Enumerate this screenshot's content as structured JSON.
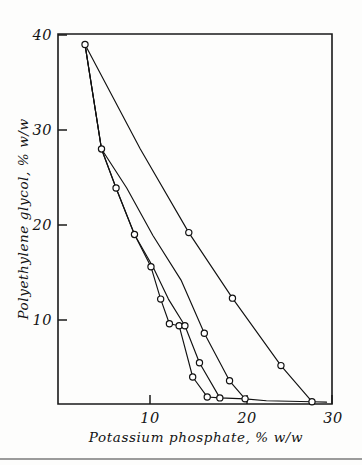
{
  "figure": {
    "background_color": "#fdfdfc",
    "line_color": "#111111",
    "marker_fill": "#ffffff"
  },
  "chart_data": {
    "type": "line",
    "title": "",
    "xlabel": "Potassium phosphate,  % w/w",
    "ylabel": "Polyethylene glycol,   % w/w",
    "xlim": [
      0.6,
      30.4
    ],
    "ylim": [
      1.1,
      40.0
    ],
    "xticks": [
      10,
      20,
      30
    ],
    "xtick_labels": [
      "10",
      "20",
      "30"
    ],
    "yticks": [
      10,
      20,
      30,
      40
    ],
    "ytick_labels": [
      "10",
      "20",
      "30",
      "40"
    ],
    "grid": false,
    "legend": "none",
    "marker": "open-circle",
    "series": [
      {
        "name": "tie-line-1",
        "x": [
          3.3,
          9.0,
          14.0,
          18.5,
          23.5,
          26.7
        ],
        "y": [
          39.0,
          28.0,
          19.2,
          12.3,
          5.2,
          1.4
        ]
      },
      {
        "name": "tie-line-2",
        "x": [
          3.3,
          5.0,
          7.6,
          10.3,
          13.2,
          15.6,
          18.2,
          19.8
        ],
        "y": [
          39.0,
          28.0,
          23.9,
          18.9,
          14.2,
          8.6,
          3.6,
          1.7
        ],
        "note": "upper branch descends to lower right"
      },
      {
        "name": "tie-line-3",
        "x": [
          3.3,
          5.0,
          6.5,
          8.4,
          10.3,
          11.9,
          13.6,
          15.1,
          17.2
        ],
        "y": [
          39.0,
          28.0,
          23.9,
          19.0,
          15.6,
          12.2,
          9.4,
          5.5,
          1.8
        ]
      },
      {
        "name": "tie-line-4",
        "x": [
          3.3,
          5.0,
          6.5,
          8.4,
          10.1,
          11.1,
          12.0,
          13.0,
          14.4,
          15.9
        ],
        "y": [
          39.0,
          28.0,
          23.9,
          19.0,
          15.6,
          12.2,
          9.6,
          9.4,
          4.0,
          1.9
        ]
      },
      {
        "name": "baseline-tail",
        "x": [
          15.9,
          17.2,
          19.8,
          22.0,
          26.7,
          28.2
        ],
        "y": [
          1.9,
          1.8,
          1.7,
          1.5,
          1.4,
          1.35
        ]
      }
    ],
    "data_points": [
      {
        "x": 3.3,
        "y": 39.0
      },
      {
        "x": 5.0,
        "y": 28.0
      },
      {
        "x": 6.5,
        "y": 23.9
      },
      {
        "x": 8.4,
        "y": 19.0
      },
      {
        "x": 10.1,
        "y": 15.6
      },
      {
        "x": 11.1,
        "y": 12.2
      },
      {
        "x": 12.0,
        "y": 9.6
      },
      {
        "x": 13.0,
        "y": 9.4
      },
      {
        "x": 14.4,
        "y": 4.0
      },
      {
        "x": 15.9,
        "y": 1.9
      },
      {
        "x": 13.6,
        "y": 9.4
      },
      {
        "x": 15.1,
        "y": 5.5
      },
      {
        "x": 17.2,
        "y": 1.8
      },
      {
        "x": 15.6,
        "y": 8.6
      },
      {
        "x": 18.2,
        "y": 3.6
      },
      {
        "x": 19.8,
        "y": 1.7
      },
      {
        "x": 14.0,
        "y": 19.2
      },
      {
        "x": 18.5,
        "y": 12.3
      },
      {
        "x": 23.5,
        "y": 5.2
      },
      {
        "x": 26.7,
        "y": 1.4
      }
    ]
  },
  "axes": {
    "x_axis_name": "Potassium phosphate,  % w/w",
    "y_axis_name": "Polyethylene glycol,   % w/w",
    "x_tick_10": "10",
    "x_tick_20": "20",
    "x_tick_30": "30",
    "y_tick_10": "10",
    "y_tick_20": "20",
    "y_tick_30": "30",
    "y_tick_40": "40"
  }
}
